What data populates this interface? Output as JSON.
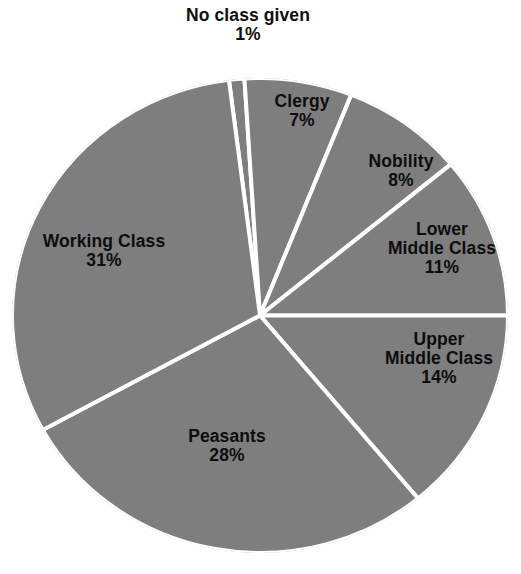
{
  "chart_data": {
    "type": "pie",
    "title": "",
    "subtitle": "",
    "xlabel": "",
    "ylabel": "",
    "legend_position": "none",
    "labels_inside": true,
    "start_angle_deg": -7.2,
    "direction": "clockwise",
    "categories": [
      "No class given",
      "Clergy",
      "Nobility",
      "Lower Middle Class",
      "Upper Middle Class",
      "Peasants",
      "Working Class"
    ],
    "values": [
      1,
      7,
      8,
      11,
      14,
      28,
      31
    ],
    "value_unit": "%",
    "slice_color": "#7e7e7e",
    "separator_color": "#ffffff",
    "background_color": "#ffffff",
    "slices": [
      {
        "label": "No class given",
        "value": 1,
        "value_text": "1%",
        "lines": [
          "No class given"
        ]
      },
      {
        "label": "Clergy",
        "value": 7,
        "value_text": "7%",
        "lines": [
          "Clergy"
        ]
      },
      {
        "label": "Nobility",
        "value": 8,
        "value_text": "8%",
        "lines": [
          "Nobility"
        ]
      },
      {
        "label": "Lower Middle Class",
        "value": 11,
        "value_text": "11%",
        "lines": [
          "Lower",
          "Middle Class"
        ]
      },
      {
        "label": "Upper Middle Class",
        "value": 14,
        "value_text": "14%",
        "lines": [
          "Upper",
          "Middle Class"
        ]
      },
      {
        "label": "Peasants",
        "value": 28,
        "value_text": "28%",
        "lines": [
          "Peasants"
        ]
      },
      {
        "label": "Working Class",
        "value": 31,
        "value_text": "31%",
        "lines": [
          "Working Class"
        ]
      }
    ]
  },
  "labels": {
    "no_class_given": {
      "line1": "No class given",
      "value": "1%"
    },
    "clergy": {
      "line1": "Clergy",
      "value": "7%"
    },
    "nobility": {
      "line1": "Nobility",
      "value": "8%"
    },
    "lower_middle": {
      "line1": "Lower",
      "line2": "Middle Class",
      "value": "11%"
    },
    "upper_middle": {
      "line1": "Upper",
      "line2": "Middle Class",
      "value": "14%"
    },
    "peasants": {
      "line1": "Peasants",
      "value": "28%"
    },
    "working_class": {
      "line1": "Working Class",
      "value": "31%"
    }
  }
}
